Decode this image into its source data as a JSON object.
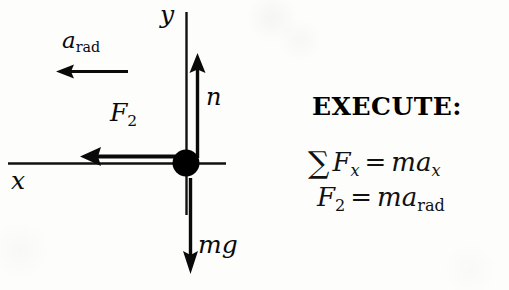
{
  "figure": {
    "type": "free-body-diagram",
    "background_color": "#fdfdfc",
    "ink_color": "#000000",
    "axes": {
      "x_label": "x",
      "y_label": "y",
      "origin_label": "particle"
    },
    "vectors": [
      {
        "name": "a_rad",
        "symbol": "a",
        "subscript": "rad",
        "direction": "left",
        "kind": "acceleration"
      },
      {
        "name": "F_2",
        "symbol": "F",
        "subscript": "2",
        "direction": "left",
        "kind": "force"
      },
      {
        "name": "n",
        "symbol": "n",
        "subscript": "",
        "direction": "up",
        "kind": "normal-force"
      },
      {
        "name": "mg",
        "symbol": "mg",
        "subscript": "",
        "direction": "down",
        "kind": "weight"
      }
    ]
  },
  "solution": {
    "heading": "EXECUTE:",
    "equations": [
      {
        "id": "sum-forces-x",
        "sigma": "∑",
        "lhs_symbol": "F",
        "lhs_subscript": "x",
        "equals": "=",
        "rhs_mass": "ma",
        "rhs_subscript": "x",
        "plain": "∑F_x = ma_x"
      },
      {
        "id": "f2-equals-ma-rad",
        "sigma": "",
        "lhs_symbol": "F",
        "lhs_subscript": "2",
        "equals": "=",
        "rhs_mass": "ma",
        "rhs_subscript": "rad",
        "plain": "F_2 = ma_rad"
      }
    ]
  },
  "labels": {
    "y": "y",
    "x": "x",
    "a": "a",
    "rad": "rad",
    "F": "F",
    "two": "2",
    "n": "n",
    "mg": "mg"
  }
}
